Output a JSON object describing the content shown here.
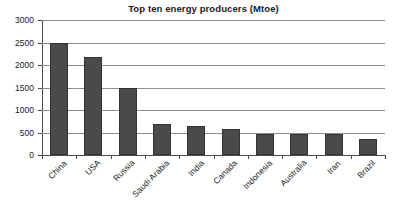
{
  "chart_data": {
    "type": "bar",
    "title": "Top ten energy producers (Mtoe)",
    "xlabel": "",
    "ylabel": "",
    "ylim": [
      0,
      3000
    ],
    "yticks": [
      0,
      500,
      1000,
      1500,
      2000,
      2500,
      3000
    ],
    "ytick_labels": [
      "0",
      "500",
      "1000",
      "1500",
      "2000",
      "2500",
      "3000"
    ],
    "grid": true,
    "legend": false,
    "categories": [
      "China",
      "USA",
      "Russia",
      "Saudi Arabia",
      "India",
      "Canada",
      "Indonesia",
      "Australia",
      "Iran",
      "Brazil"
    ],
    "values": [
      2500,
      2170,
      1500,
      700,
      640,
      570,
      475,
      475,
      460,
      350
    ],
    "bar_color": "#4a4a4a",
    "bar_border_color": "#333333",
    "gridline_color": "#8c8c8c",
    "axis_color": "#4d4d4d",
    "background_color": "#ffffff"
  }
}
